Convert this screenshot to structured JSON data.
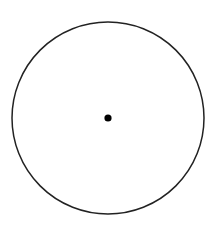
{
  "diagram": {
    "title": "",
    "shapes": [
      {
        "type": "circle",
        "name": "outer-circle",
        "cx": 108,
        "cy": 118,
        "r": 96,
        "stroke": "#222222",
        "stroke_width": 1.5,
        "fill": "none"
      },
      {
        "type": "point",
        "name": "center-point",
        "cx": 108,
        "cy": 118,
        "r": 3.6,
        "fill": "#000000"
      }
    ]
  },
  "colors": {
    "background": "#ffffff",
    "stroke": "#222222",
    "point": "#000000"
  }
}
